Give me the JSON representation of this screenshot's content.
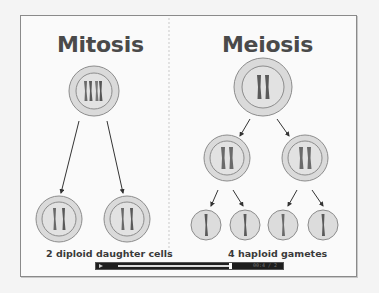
{
  "diagram": {
    "mitosis": {
      "title": "Mitosis",
      "result_label": "2 diploid daughter cells",
      "parent_cell": {
        "chromosomes": 4,
        "type": "diploid"
      },
      "daughter_cells": [
        {
          "chromosomes": 2
        },
        {
          "chromosomes": 2
        }
      ]
    },
    "meiosis": {
      "title": "Meiosis",
      "result_label": "4 haploid gametes",
      "parent_cell": {
        "chromosomes": 2,
        "type": "diploid"
      },
      "intermediate_cells": [
        {
          "chromosomes": 2
        },
        {
          "chromosomes": 2
        }
      ],
      "gametes": [
        {
          "chromosomes": 1
        },
        {
          "chromosomes": 1
        },
        {
          "chromosomes": 1
        },
        {
          "chromosomes": 1
        }
      ]
    },
    "colors": {
      "cell_fill": "#d9d9d9",
      "cell_outline": "#8c8c8c",
      "chromosome_dark": "#5a5a5a",
      "chromosome_mid": "#7a7a7a",
      "arrow": "#333333",
      "title_text": "#4a4a4a"
    }
  },
  "video_controls": {
    "play_icon": "play-icon",
    "progress_percent": 60,
    "time": "00:4 / 2"
  }
}
